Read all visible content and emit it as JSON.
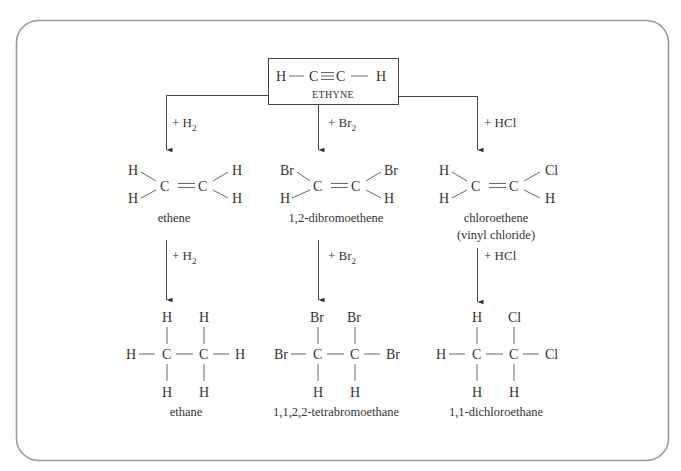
{
  "diagram": {
    "start": {
      "formula": "H — C ≡ C — H",
      "parts": [
        "H",
        "C",
        "C",
        "H"
      ],
      "name": "ETHYNE"
    },
    "branches": [
      {
        "reagent_1": {
          "prefix": "+ H",
          "sub": "2"
        },
        "intermediate": {
          "name": "ethene",
          "left_top": "H",
          "left_bottom": "H",
          "right_top": "H",
          "right_bottom": "H",
          "c1": "C",
          "c2": "C"
        },
        "reagent_2": {
          "prefix": "+ H",
          "sub": "2"
        },
        "product": {
          "name": "ethane",
          "left": "H",
          "right": "H",
          "c1_top": "H",
          "c1_bottom": "H",
          "c2_top": "H",
          "c2_bottom": "H",
          "c1": "C",
          "c2": "C"
        }
      },
      {
        "reagent_1": {
          "prefix": "+ Br",
          "sub": "2"
        },
        "intermediate": {
          "name": "1,2-dibromoethene",
          "left_top": "Br",
          "left_bottom": "H",
          "right_top": "Br",
          "right_bottom": "H",
          "c1": "C",
          "c2": "C"
        },
        "reagent_2": {
          "prefix": "+ Br",
          "sub": "2"
        },
        "product": {
          "name": "1,1,2,2-tetrabromoethane",
          "left": "Br",
          "right": "Br",
          "c1_top": "Br",
          "c1_bottom": "H",
          "c2_top": "Br",
          "c2_bottom": "H",
          "c1": "C",
          "c2": "C"
        }
      },
      {
        "reagent_1": {
          "prefix": "+ HCl",
          "sub": ""
        },
        "intermediate": {
          "name": "chloroethene",
          "alt_name": "(vinyl chloride)",
          "left_top": "H",
          "left_bottom": "H",
          "right_top": "Cl",
          "right_bottom": "H",
          "c1": "C",
          "c2": "C"
        },
        "reagent_2": {
          "prefix": "+ HCl",
          "sub": ""
        },
        "product": {
          "name": "1,1-dichloroethane",
          "left": "H",
          "right": "Cl",
          "c1_top": "H",
          "c1_bottom": "H",
          "c2_top": "Cl",
          "c2_bottom": "H",
          "c1": "C",
          "c2": "C"
        }
      }
    ],
    "colors": {
      "frame": "#9a9a9a",
      "text": "#333333",
      "lines": "#444444"
    }
  }
}
